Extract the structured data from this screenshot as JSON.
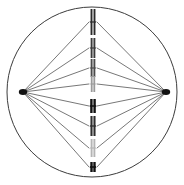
{
  "figure": {
    "background_color": "#ffffff",
    "width": 184,
    "height": 185
  },
  "cell_membrane": {
    "label": "cell-membrane",
    "shape": "circle",
    "cx": 92,
    "cy": 92,
    "r": 85,
    "stroke_color": "#3c3c3c",
    "stroke_width": 1,
    "fill": "none"
  },
  "poles": [
    {
      "label": "left-centrosome",
      "cx": 23,
      "cy": 92,
      "rx": 4.2,
      "ry": 3.0,
      "color": "#111111"
    },
    {
      "label": "right-centrosome",
      "cx": 166,
      "cy": 92,
      "rx": 4.2,
      "ry": 3.0,
      "color": "#111111"
    }
  ],
  "metaphase_plate": {
    "label": "metaphase-plate",
    "x": 93,
    "chromosome_count": 8
  },
  "chromosomes": [
    {
      "label": "chromosome-1",
      "cx": 93,
      "cy": 22,
      "half_height": 13,
      "arm_gap": 3.0,
      "chromatid_width": 1.9,
      "color": "#2b2b2b",
      "centromere_width": 6.2,
      "centromere_thickness": 1.2
    },
    {
      "label": "chromosome-2",
      "cx": 93,
      "cy": 48,
      "half_height": 10,
      "arm_gap": 2.8,
      "chromatid_width": 1.9,
      "color": "#3a3a3a",
      "centromere_width": 5.8,
      "centromere_thickness": 1.2
    },
    {
      "label": "chromosome-3",
      "cx": 93,
      "cy": 68,
      "half_height": 9,
      "arm_gap": 2.8,
      "chromatid_width": 1.9,
      "color": "#4a4a4a",
      "centromere_width": 5.6,
      "centromere_thickness": 1.2
    },
    {
      "label": "chromosome-4",
      "cx": 93,
      "cy": 84,
      "half_height": 8,
      "arm_gap": 2.6,
      "chromatid_width": 1.8,
      "color": "#9a9a9a",
      "centromere_width": 5.2,
      "centromere_thickness": 1.1
    },
    {
      "label": "chromosome-5",
      "cx": 93,
      "cy": 106,
      "half_height": 7,
      "arm_gap": 3.2,
      "chromatid_width": 2.4,
      "color": "#111111",
      "centromere_width": 6.4,
      "centromere_thickness": 1.5
    },
    {
      "label": "chromosome-6",
      "cx": 93,
      "cy": 126,
      "half_height": 10,
      "arm_gap": 3.0,
      "chromatid_width": 2.1,
      "color": "#2e2e2e",
      "centromere_width": 6.0,
      "centromere_thickness": 1.3
    },
    {
      "label": "chromosome-7",
      "cx": 93,
      "cy": 148,
      "half_height": 9,
      "arm_gap": 2.8,
      "chromatid_width": 1.9,
      "color": "#b4b4b4",
      "centromere_width": 5.6,
      "centromere_thickness": 1.2
    },
    {
      "label": "chromosome-8",
      "cx": 93,
      "cy": 167,
      "half_height": 5,
      "arm_gap": 3.0,
      "chromatid_width": 2.4,
      "color": "#111111",
      "centromere_width": 6.2,
      "centromere_thickness": 1.6
    }
  ],
  "spindle_fibers": {
    "label": "spindle-fibers",
    "stroke_color": "#4a4a4a",
    "stroke_width": 0.75,
    "attachment_offset": 4,
    "targets_y": [
      22,
      48,
      68,
      84,
      106,
      126,
      148,
      167
    ]
  }
}
